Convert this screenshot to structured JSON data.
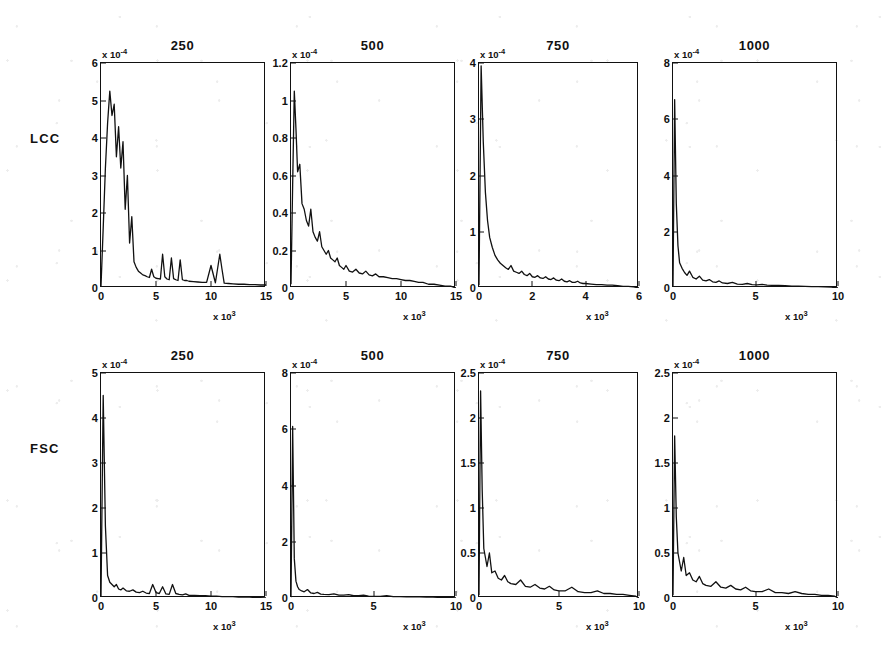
{
  "figure": {
    "row_labels": [
      "LCC",
      "FSC"
    ],
    "column_titles": [
      "250",
      "500",
      "750",
      "1000"
    ],
    "line_color": "#111111",
    "axis_color": "#111111",
    "background_color": "#ffffff"
  },
  "chart_data": [
    {
      "type": "line",
      "title": "250",
      "row": "LCC",
      "xlabel": "x 10",
      "x_exponent": "3",
      "ylabel": "",
      "y_exponent": "-4",
      "xlim": [
        0,
        15
      ],
      "ylim": [
        0,
        6
      ],
      "xticks": [
        0,
        5,
        10,
        15
      ],
      "xticklabels": [
        "0",
        "5",
        "10",
        "15"
      ],
      "yticks": [
        0,
        1,
        2,
        3,
        4,
        5,
        6
      ],
      "yticklabels": [
        "0",
        "1",
        "2",
        "3",
        "4",
        "5",
        "6"
      ],
      "grid": false,
      "legend": "none",
      "x": [
        0.0,
        0.2,
        0.4,
        0.6,
        0.8,
        1.0,
        1.2,
        1.4,
        1.6,
        1.8,
        2.0,
        2.2,
        2.4,
        2.6,
        2.8,
        3.0,
        3.2,
        3.4,
        3.6,
        3.8,
        4.0,
        4.2,
        4.4,
        4.6,
        4.8,
        5.0,
        5.2,
        5.4,
        5.6,
        5.8,
        6.0,
        6.2,
        6.4,
        6.6,
        6.8,
        7.0,
        7.2,
        7.4,
        7.6,
        7.8,
        8.0,
        8.4,
        8.8,
        9.2,
        9.6,
        10.0,
        10.4,
        10.8,
        11.0,
        11.2,
        11.6,
        12.0,
        12.5,
        13.0,
        13.5,
        14.0,
        14.5,
        15.0
      ],
      "y": [
        0.05,
        1.6,
        3.2,
        4.4,
        5.25,
        4.6,
        4.9,
        3.5,
        4.3,
        3.2,
        3.9,
        2.1,
        3.0,
        1.2,
        1.9,
        0.7,
        0.55,
        0.45,
        0.4,
        0.35,
        0.33,
        0.3,
        0.28,
        0.5,
        0.3,
        0.26,
        0.25,
        0.24,
        0.9,
        0.3,
        0.24,
        0.22,
        0.8,
        0.25,
        0.22,
        0.2,
        0.75,
        0.22,
        0.2,
        0.2,
        0.18,
        0.17,
        0.16,
        0.15,
        0.15,
        0.6,
        0.14,
        0.9,
        0.5,
        0.13,
        0.12,
        0.11,
        0.1,
        0.1,
        0.09,
        0.09,
        0.08,
        0.08
      ]
    },
    {
      "type": "line",
      "title": "500",
      "row": "LCC",
      "xlabel": "x 10",
      "x_exponent": "3",
      "ylabel": "",
      "y_exponent": "-4",
      "xlim": [
        0,
        15
      ],
      "ylim": [
        0,
        1.2
      ],
      "xticks": [
        0,
        5,
        10,
        15
      ],
      "xticklabels": [
        "0",
        "5",
        "10",
        "15"
      ],
      "yticks": [
        0,
        0.2,
        0.4,
        0.6,
        0.8,
        1,
        1.2
      ],
      "yticklabels": [
        "0",
        "0.2",
        "0.4",
        "0.6",
        "0.8",
        "1",
        "1.2"
      ],
      "grid": false,
      "legend": "none",
      "x": [
        0.0,
        0.15,
        0.3,
        0.45,
        0.6,
        0.8,
        1.0,
        1.2,
        1.4,
        1.6,
        1.8,
        2.0,
        2.2,
        2.4,
        2.6,
        2.8,
        3.0,
        3.2,
        3.4,
        3.6,
        3.8,
        4.0,
        4.2,
        4.4,
        4.6,
        4.8,
        5.0,
        5.3,
        5.6,
        5.9,
        6.2,
        6.5,
        6.8,
        7.1,
        7.4,
        7.7,
        8.0,
        8.4,
        8.8,
        9.2,
        9.6,
        10.0,
        10.4,
        10.8,
        11.2,
        11.6,
        12.0,
        12.5,
        13.0,
        13.5,
        14.0,
        14.5,
        15.0
      ],
      "y": [
        0.02,
        0.55,
        1.05,
        0.85,
        0.62,
        0.66,
        0.45,
        0.42,
        0.36,
        0.33,
        0.42,
        0.3,
        0.27,
        0.25,
        0.3,
        0.22,
        0.2,
        0.18,
        0.2,
        0.16,
        0.15,
        0.14,
        0.16,
        0.12,
        0.11,
        0.1,
        0.12,
        0.09,
        0.085,
        0.1,
        0.08,
        0.075,
        0.09,
        0.07,
        0.065,
        0.075,
        0.06,
        0.06,
        0.055,
        0.05,
        0.05,
        0.045,
        0.04,
        0.04,
        0.035,
        0.03,
        0.03,
        0.02,
        0.02,
        0.015,
        0.01,
        0.01,
        0.0
      ]
    },
    {
      "type": "line",
      "title": "750",
      "row": "LCC",
      "xlabel": "x 10",
      "x_exponent": "3",
      "ylabel": "",
      "y_exponent": "-4",
      "xlim": [
        0,
        6
      ],
      "ylim": [
        0,
        4
      ],
      "xticks": [
        0,
        2,
        4,
        6
      ],
      "xticklabels": [
        "0",
        "2",
        "4",
        "6"
      ],
      "yticks": [
        0,
        1,
        2,
        3,
        4
      ],
      "yticklabels": [
        "0",
        "1",
        "2",
        "3",
        "4"
      ],
      "grid": false,
      "legend": "none",
      "x": [
        0.0,
        0.08,
        0.16,
        0.24,
        0.32,
        0.4,
        0.5,
        0.6,
        0.7,
        0.8,
        0.9,
        1.0,
        1.1,
        1.2,
        1.3,
        1.4,
        1.5,
        1.6,
        1.7,
        1.8,
        1.9,
        2.0,
        2.1,
        2.2,
        2.3,
        2.4,
        2.5,
        2.6,
        2.7,
        2.8,
        2.9,
        3.0,
        3.1,
        3.2,
        3.3,
        3.4,
        3.5,
        3.6,
        3.7,
        3.8,
        3.9,
        4.0,
        4.2,
        4.4,
        4.6,
        4.8,
        5.0,
        5.2,
        5.4,
        5.6,
        5.8,
        6.0
      ],
      "y": [
        0.05,
        3.95,
        2.6,
        1.7,
        1.2,
        0.9,
        0.72,
        0.58,
        0.5,
        0.44,
        0.4,
        0.36,
        0.33,
        0.4,
        0.3,
        0.28,
        0.26,
        0.3,
        0.24,
        0.22,
        0.26,
        0.2,
        0.19,
        0.22,
        0.18,
        0.17,
        0.2,
        0.16,
        0.15,
        0.18,
        0.14,
        0.13,
        0.16,
        0.12,
        0.11,
        0.13,
        0.1,
        0.1,
        0.12,
        0.09,
        0.08,
        0.08,
        0.07,
        0.06,
        0.06,
        0.05,
        0.05,
        0.04,
        0.03,
        0.03,
        0.02,
        0.0
      ]
    },
    {
      "type": "line",
      "title": "1000",
      "row": "LCC",
      "xlabel": "x 10",
      "x_exponent": "3",
      "ylabel": "",
      "y_exponent": "-4",
      "xlim": [
        0,
        10
      ],
      "ylim": [
        0,
        8
      ],
      "xticks": [
        0,
        5,
        10
      ],
      "xticklabels": [
        "0",
        "5",
        "10"
      ],
      "yticks": [
        0,
        2,
        4,
        6,
        8
      ],
      "yticklabels": [
        "0",
        "2",
        "4",
        "6",
        "8"
      ],
      "grid": false,
      "legend": "none",
      "x": [
        0.0,
        0.1,
        0.2,
        0.3,
        0.4,
        0.55,
        0.7,
        0.85,
        1.0,
        1.2,
        1.4,
        1.6,
        1.8,
        2.0,
        2.2,
        2.4,
        2.6,
        2.8,
        3.0,
        3.3,
        3.6,
        3.9,
        4.2,
        4.5,
        4.8,
        5.1,
        5.4,
        5.7,
        6.0,
        6.4,
        6.8,
        7.2,
        7.6,
        8.0,
        8.4,
        8.8,
        9.2,
        9.6,
        10.0
      ],
      "y": [
        0.05,
        6.7,
        3.0,
        1.5,
        0.9,
        0.7,
        0.55,
        0.45,
        0.6,
        0.38,
        0.32,
        0.42,
        0.28,
        0.25,
        0.3,
        0.22,
        0.2,
        0.25,
        0.18,
        0.16,
        0.2,
        0.14,
        0.13,
        0.16,
        0.12,
        0.11,
        0.13,
        0.1,
        0.09,
        0.09,
        0.08,
        0.07,
        0.07,
        0.06,
        0.05,
        0.05,
        0.04,
        0.03,
        0.0
      ]
    },
    {
      "type": "line",
      "title": "250",
      "row": "FSC",
      "xlabel": "x 10",
      "x_exponent": "3",
      "ylabel": "",
      "y_exponent": "-4",
      "xlim": [
        0,
        15
      ],
      "ylim": [
        0,
        5
      ],
      "xticks": [
        0,
        5,
        10,
        15
      ],
      "xticklabels": [
        "0",
        "5",
        "10",
        "15"
      ],
      "yticks": [
        0,
        1,
        2,
        3,
        4,
        5
      ],
      "yticklabels": [
        "0",
        "1",
        "2",
        "3",
        "4",
        "5"
      ],
      "grid": false,
      "legend": "none",
      "x": [
        0.0,
        0.2,
        0.4,
        0.6,
        0.8,
        1.0,
        1.2,
        1.4,
        1.6,
        1.8,
        2.0,
        2.3,
        2.6,
        2.9,
        3.2,
        3.5,
        3.8,
        4.1,
        4.4,
        4.7,
        5.0,
        5.3,
        5.6,
        5.9,
        6.2,
        6.5,
        6.8,
        7.1,
        7.4,
        7.7,
        8.0,
        8.5,
        9.0,
        9.5,
        10.0,
        10.5,
        11.0,
        11.5,
        12.0,
        12.5,
        13.0,
        13.5,
        14.0,
        14.5,
        15.0
      ],
      "y": [
        0.03,
        4.5,
        1.6,
        0.5,
        0.35,
        0.3,
        0.25,
        0.3,
        0.2,
        0.18,
        0.22,
        0.16,
        0.15,
        0.18,
        0.13,
        0.12,
        0.15,
        0.11,
        0.1,
        0.3,
        0.12,
        0.1,
        0.25,
        0.09,
        0.08,
        0.3,
        0.1,
        0.08,
        0.07,
        0.09,
        0.06,
        0.06,
        0.05,
        0.05,
        0.04,
        0.04,
        0.03,
        0.03,
        0.03,
        0.02,
        0.02,
        0.02,
        0.01,
        0.01,
        0.0
      ]
    },
    {
      "type": "line",
      "title": "500",
      "row": "FSC",
      "xlabel": "x 10",
      "x_exponent": "3",
      "ylabel": "",
      "y_exponent": "-4",
      "xlim": [
        0,
        10
      ],
      "ylim": [
        0,
        8
      ],
      "xticks": [
        0,
        5,
        10
      ],
      "xticklabels": [
        "0",
        "5",
        "10"
      ],
      "yticks": [
        0,
        2,
        4,
        6,
        8
      ],
      "yticklabels": [
        "0",
        "2",
        "4",
        "6",
        "8"
      ],
      "grid": false,
      "legend": "none",
      "x": [
        0.0,
        0.1,
        0.2,
        0.3,
        0.4,
        0.5,
        0.65,
        0.8,
        1.0,
        1.2,
        1.4,
        1.6,
        1.8,
        2.0,
        2.3,
        2.6,
        2.9,
        3.2,
        3.5,
        3.8,
        4.1,
        4.4,
        4.7,
        5.0,
        5.4,
        5.8,
        6.2,
        6.6,
        7.0,
        7.4,
        7.8,
        8.2,
        8.6,
        9.0,
        9.4,
        9.8,
        10.0
      ],
      "y": [
        0.03,
        6.1,
        1.4,
        0.6,
        0.4,
        0.3,
        0.25,
        0.22,
        0.3,
        0.18,
        0.16,
        0.2,
        0.14,
        0.13,
        0.12,
        0.15,
        0.1,
        0.1,
        0.12,
        0.08,
        0.08,
        0.1,
        0.07,
        0.06,
        0.06,
        0.08,
        0.05,
        0.05,
        0.04,
        0.05,
        0.04,
        0.03,
        0.03,
        0.02,
        0.02,
        0.01,
        0.0
      ]
    },
    {
      "type": "line",
      "title": "750",
      "row": "FSC",
      "xlabel": "x 10",
      "x_exponent": "3",
      "ylabel": "",
      "y_exponent": "-4",
      "xlim": [
        0,
        10
      ],
      "ylim": [
        0,
        2.5
      ],
      "xticks": [
        0,
        5,
        10
      ],
      "xticklabels": [
        "0",
        "5",
        "10"
      ],
      "yticks": [
        0,
        0.5,
        1,
        1.5,
        2,
        2.5
      ],
      "yticklabels": [
        "0",
        "0.5",
        "1",
        "1.5",
        "2",
        "2.5"
      ],
      "grid": false,
      "legend": "none",
      "x": [
        0.0,
        0.1,
        0.2,
        0.3,
        0.4,
        0.5,
        0.65,
        0.8,
        1.0,
        1.2,
        1.4,
        1.6,
        1.8,
        2.0,
        2.3,
        2.6,
        2.9,
        3.2,
        3.5,
        3.8,
        4.1,
        4.4,
        4.7,
        5.0,
        5.4,
        5.8,
        6.2,
        6.6,
        7.0,
        7.4,
        7.8,
        8.2,
        8.6,
        9.0,
        9.4,
        9.8,
        10.0
      ],
      "y": [
        0.03,
        2.3,
        1.2,
        0.55,
        0.45,
        0.35,
        0.5,
        0.28,
        0.3,
        0.22,
        0.2,
        0.25,
        0.18,
        0.16,
        0.15,
        0.2,
        0.13,
        0.12,
        0.15,
        0.11,
        0.1,
        0.13,
        0.09,
        0.08,
        0.08,
        0.12,
        0.07,
        0.06,
        0.06,
        0.08,
        0.05,
        0.05,
        0.04,
        0.04,
        0.03,
        0.02,
        0.0
      ]
    },
    {
      "type": "line",
      "title": "1000",
      "row": "FSC",
      "xlabel": "x 10",
      "x_exponent": "3",
      "ylabel": "",
      "y_exponent": "-4",
      "xlim": [
        0,
        10
      ],
      "ylim": [
        0,
        2.5
      ],
      "xticks": [
        0,
        5,
        10
      ],
      "xticklabels": [
        "0",
        "5",
        "10"
      ],
      "yticks": [
        0,
        0.5,
        1,
        1.5,
        2,
        2.5
      ],
      "yticklabels": [
        "0",
        "0.5",
        "1",
        "1.5",
        "2",
        "2.5"
      ],
      "grid": false,
      "legend": "none",
      "x": [
        0.0,
        0.1,
        0.2,
        0.3,
        0.4,
        0.5,
        0.65,
        0.8,
        1.0,
        1.2,
        1.4,
        1.6,
        1.8,
        2.0,
        2.3,
        2.6,
        2.9,
        3.2,
        3.5,
        3.8,
        4.1,
        4.4,
        4.7,
        5.0,
        5.4,
        5.8,
        6.2,
        6.6,
        7.0,
        7.4,
        7.8,
        8.2,
        8.6,
        9.0,
        9.4,
        9.8,
        10.0
      ],
      "y": [
        0.03,
        1.8,
        0.9,
        0.5,
        0.4,
        0.3,
        0.45,
        0.25,
        0.28,
        0.2,
        0.18,
        0.24,
        0.16,
        0.14,
        0.13,
        0.18,
        0.12,
        0.11,
        0.14,
        0.1,
        0.09,
        0.12,
        0.08,
        0.07,
        0.07,
        0.1,
        0.06,
        0.06,
        0.05,
        0.07,
        0.05,
        0.04,
        0.04,
        0.03,
        0.03,
        0.02,
        0.0
      ]
    }
  ]
}
